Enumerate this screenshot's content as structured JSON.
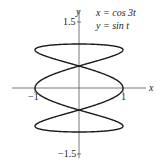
{
  "chart_data": {
    "type": "line",
    "title": "",
    "annotation": [
      "x = cos 3t",
      "y = sin t"
    ],
    "xlabel": "x",
    "ylabel": "y",
    "x_ticks": [
      "−1",
      "1"
    ],
    "y_ticks": [
      "1.5",
      "−1.5"
    ],
    "xlim": [
      -1.5,
      1.5
    ],
    "ylim": [
      -1.5,
      1.5
    ],
    "grid": false,
    "series": [
      {
        "name": "parametric curve",
        "x_expr": "cos(3t)",
        "y_expr": "sin(t)",
        "t_range": [
          0,
          6.2832
        ]
      }
    ]
  },
  "labels": {
    "x_axis": "x",
    "y_axis": "y",
    "x_neg_tick": "−1",
    "x_pos_tick": "1",
    "y_top_tick": "1.5",
    "y_bottom_tick": "−1.5",
    "eq_x": "x = cos 3t",
    "eq_y": "y = sin t"
  },
  "colors": {
    "curve": "#1a1a1a",
    "axis": "#333333"
  }
}
